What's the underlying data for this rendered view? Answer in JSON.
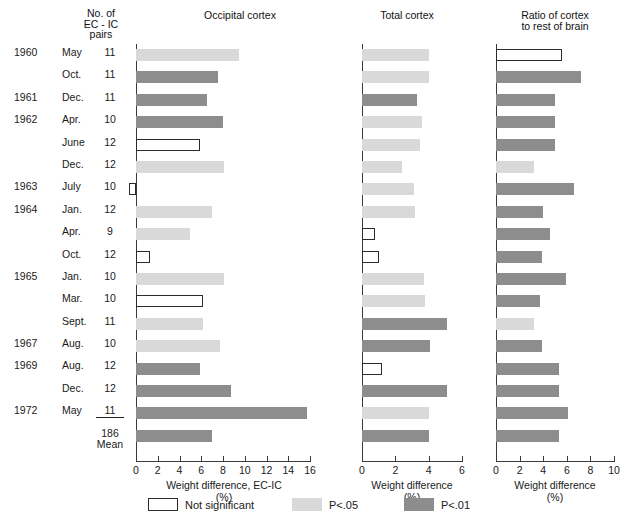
{
  "headers": {
    "pairs_line1": "No. of",
    "pairs_line2": "EC - IC",
    "pairs_line3": "pairs",
    "occipital": "Occipital cortex",
    "total": "Total cortex",
    "ratio_line1": "Ratio of cortex",
    "ratio_line2": "to rest of brain"
  },
  "axis_titles": {
    "occipital_line1": "Weight difference, EC-IC",
    "occipital_line2": "(%)",
    "total_line1": "Weight difference",
    "total_line2": "(%)",
    "ratio_line1": "Weight difference",
    "ratio_line2": "(%)"
  },
  "legend": [
    {
      "label": "Not significant",
      "class": "ns",
      "color": "#ffffff"
    },
    {
      "label": "P<.05",
      "class": "p05",
      "color": "#d9d9d9"
    },
    {
      "label": "P<.01",
      "class": "p01",
      "color": "#8d8d8d"
    }
  ],
  "totals": {
    "n_total": "186",
    "mean_label": "Mean"
  },
  "chart_data": {
    "type": "bar",
    "orientation": "horizontal",
    "grid": false,
    "legend_position": "bottom",
    "row_label_columns": [
      "Year",
      "Month",
      "No. of EC-IC pairs"
    ],
    "rows": [
      {
        "year": "1960",
        "month": "May",
        "pairs": "11"
      },
      {
        "year": "",
        "month": "Oct.",
        "pairs": "11"
      },
      {
        "year": "1961",
        "month": "Dec.",
        "pairs": "11"
      },
      {
        "year": "1962",
        "month": "Apr.",
        "pairs": "10"
      },
      {
        "year": "",
        "month": "June",
        "pairs": "12"
      },
      {
        "year": "",
        "month": "Dec.",
        "pairs": "12"
      },
      {
        "year": "1963",
        "month": "July",
        "pairs": "10"
      },
      {
        "year": "1964",
        "month": "Jan.",
        "pairs": "12"
      },
      {
        "year": "",
        "month": "Apr.",
        "pairs": "9"
      },
      {
        "year": "",
        "month": "Oct.",
        "pairs": "12"
      },
      {
        "year": "1965",
        "month": "Jan.",
        "pairs": "10"
      },
      {
        "year": "",
        "month": "Mar.",
        "pairs": "10"
      },
      {
        "year": "",
        "month": "Sept.",
        "pairs": "11"
      },
      {
        "year": "1967",
        "month": "Aug.",
        "pairs": "10"
      },
      {
        "year": "1969",
        "month": "Aug.",
        "pairs": "12"
      },
      {
        "year": "",
        "month": "Dec.",
        "pairs": "12"
      },
      {
        "year": "1972",
        "month": "May",
        "pairs": "11"
      },
      {
        "year": "",
        "month": "Mean",
        "pairs": "186"
      }
    ],
    "panels": [
      {
        "name": "occipital-cortex",
        "title": "Occipital cortex",
        "xlabel": "Weight difference, EC-IC (%)",
        "xlim": [
          0,
          16
        ],
        "xmin_display": -1,
        "ticks": [
          0,
          2,
          4,
          6,
          8,
          10,
          12,
          14,
          16
        ],
        "values": [
          9.5,
          7.5,
          6.5,
          8.0,
          5.9,
          8.1,
          -0.6,
          7.0,
          5.0,
          1.3,
          8.1,
          6.2,
          6.2,
          7.7,
          5.9,
          8.7,
          15.7,
          7.0
        ],
        "significance": [
          "p05",
          "p01",
          "p01",
          "p01",
          "ns",
          "p05",
          "ns",
          "p05",
          "p05",
          "ns",
          "p05",
          "ns",
          "p05",
          "p05",
          "p01",
          "p01",
          "p01",
          "p01"
        ]
      },
      {
        "name": "total-cortex",
        "title": "Total cortex",
        "xlabel": "Weight difference (%)",
        "xlim": [
          0,
          6
        ],
        "xmin_display": 0,
        "ticks": [
          0,
          2,
          4,
          6
        ],
        "values": [
          4.0,
          4.0,
          3.3,
          3.6,
          3.5,
          2.4,
          3.1,
          3.2,
          0.8,
          1.0,
          3.7,
          3.8,
          5.1,
          4.1,
          1.2,
          5.1,
          4.0,
          4.0
        ],
        "significance": [
          "p05",
          "p05",
          "p01",
          "p05",
          "p05",
          "p05",
          "p05",
          "p05",
          "ns",
          "ns",
          "p05",
          "p05",
          "p01",
          "p01",
          "ns",
          "p01",
          "p05",
          "p01"
        ]
      },
      {
        "name": "ratio-cortex-to-rest-of-brain",
        "title": "Ratio of cortex to rest of brain",
        "xlabel": "Weight difference (%)",
        "xlim": [
          0,
          10
        ],
        "xmin_display": 0,
        "ticks": [
          0,
          2,
          4,
          6,
          8,
          10
        ],
        "values": [
          5.6,
          7.2,
          5.0,
          5.0,
          5.0,
          3.2,
          6.6,
          4.0,
          4.6,
          3.9,
          5.9,
          3.7,
          3.2,
          3.9,
          5.3,
          5.3,
          6.1,
          5.3
        ],
        "significance": [
          "ns",
          "p01",
          "p01",
          "p01",
          "p01",
          "p05",
          "p01",
          "p01",
          "p01",
          "p01",
          "p01",
          "p01",
          "p05",
          "p01",
          "p01",
          "p01",
          "p01",
          "p01"
        ]
      }
    ]
  }
}
